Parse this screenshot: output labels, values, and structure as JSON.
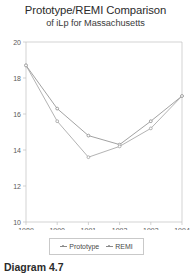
{
  "chart_data": {
    "type": "line",
    "title": "Prototype/REMI Comparison",
    "subtitle": "of iLp for Massachusetts",
    "xlabel": "",
    "ylabel": "",
    "categories": [
      "1989",
      "1990",
      "1991",
      "1992",
      "1993",
      "1994"
    ],
    "x": [
      1989,
      1990,
      1991,
      1992,
      1993,
      1994
    ],
    "series": [
      {
        "name": "Prototype",
        "color": "#8a8a8a",
        "values": [
          18.7,
          16.3,
          14.8,
          14.3,
          15.6,
          17.0
        ]
      },
      {
        "name": "REMI",
        "color": "#a0a0a0",
        "values": [
          18.7,
          15.6,
          13.6,
          14.2,
          15.2,
          17.0
        ]
      }
    ],
    "ylim": [
      10,
      20
    ],
    "yticks": [
      10,
      12,
      14,
      16,
      18,
      20
    ],
    "ytick_labels": [
      "10",
      "12",
      "14",
      "16",
      "18",
      "20"
    ],
    "xticks": [
      1989,
      1990,
      1991,
      1992,
      1993,
      1994
    ],
    "xtick_labels": [
      "1989",
      "1990",
      "1991",
      "1992",
      "1993",
      "1994"
    ],
    "grid": false,
    "legend_position": "bottom",
    "legend_entries": [
      "Prototype",
      "REMI"
    ]
  },
  "figure": {
    "caption": "Diagram 4.7",
    "axis_color": "#c0c0c0",
    "text_color": "#3a3a3a",
    "background": "#ffffff"
  }
}
